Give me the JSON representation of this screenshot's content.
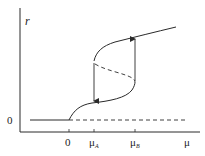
{
  "diagram": {
    "type": "bifurcation-hysteresis",
    "y_axis_label": "r",
    "x_axis_label": "μ",
    "y_tick_zero": "0",
    "x_ticks": [
      {
        "label": "0",
        "sub": ""
      },
      {
        "label": "μ",
        "sub": "A"
      },
      {
        "label": "μ",
        "sub": "B"
      }
    ],
    "branches": {
      "trivial_stable": "solid line r=0 for μ<0",
      "trivial_unstable": "dashed line r=0 for μ>0",
      "lower_stable": "solid curve from 0 rising to μB",
      "upper_stable": "solid curve from μA rising onward",
      "middle_unstable": "dashed curve between μA and μB"
    },
    "arrows": [
      {
        "at": "μA",
        "direction": "down"
      },
      {
        "at": "μB",
        "direction": "up"
      }
    ],
    "colors": {
      "line": "#2a2a2a",
      "background": "#ffffff"
    }
  }
}
